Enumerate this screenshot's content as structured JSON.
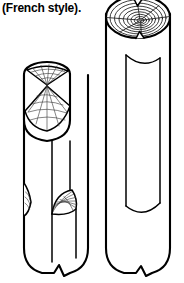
{
  "figure": {
    "caption": "(French style).",
    "type": "line-art technical illustration",
    "colors": {
      "ink": "#000000",
      "paper": "#ffffff",
      "detail_ink": "#333333"
    },
    "objects": [
      {
        "id": "left-log",
        "name": "left-log-billet",
        "description": "upright log with an angled wedge-split face near the top and a scarf notch on the lower right side",
        "features": [
          "elliptical top rim",
          "pie-wedge split face with radial grain lines",
          "diagonal riven slope",
          "lower scarf notch with fan hatching",
          "rounded bottom with break symbol"
        ]
      },
      {
        "id": "right-log",
        "name": "right-log-billet",
        "description": "upright log showing end-grain growth rings on top and a long plank face riven down the side",
        "features": [
          "end grain with concentric annual rings",
          "radial checks and splits",
          "long vertical plank face",
          "rounded bottom with break symbol"
        ]
      }
    ],
    "annotations": {
      "break_symbol": "zigzag break line indicating the log continues below"
    }
  }
}
